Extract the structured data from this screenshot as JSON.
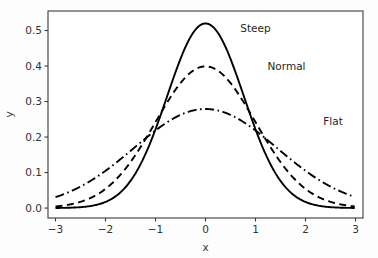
{
  "chart_data": {
    "type": "line",
    "title": "",
    "xlabel": "x",
    "ylabel": "y",
    "xlim": [
      -3.15,
      3.15
    ],
    "ylim": [
      -0.028,
      0.555
    ],
    "xticks": [
      -3,
      -2,
      -1,
      0,
      1,
      2,
      3
    ],
    "xticklabels": [
      "−3",
      "−2",
      "−1",
      "0",
      "1",
      "2",
      "3"
    ],
    "yticks": [
      0.0,
      0.1,
      0.2,
      0.3,
      0.4,
      0.5
    ],
    "yticklabels": [
      "0.0",
      "0.1",
      "0.2",
      "0.3",
      "0.4",
      "0.5"
    ],
    "grid": false,
    "legend_position": "inline-annotations",
    "series": [
      {
        "name": "Steep",
        "linestyle": "solid",
        "color": "#000000",
        "sigma": 0.766,
        "mu": 0,
        "peak_value": 0.52,
        "x": [
          -3.0,
          -2.75,
          -2.5,
          -2.25,
          -2.0,
          -1.75,
          -1.5,
          -1.25,
          -1.0,
          -0.75,
          -0.5,
          -0.25,
          0.0,
          0.25,
          0.5,
          0.75,
          1.0,
          1.25,
          1.5,
          1.75,
          2.0,
          2.25,
          2.5,
          2.75,
          3.0
        ],
        "values": [
          0.0005,
          0.0019,
          0.0061,
          0.0166,
          0.0389,
          0.0784,
          0.1361,
          0.2037,
          0.2629,
          0.2929,
          0.2819,
          0.2341,
          0.2069,
          0.2341,
          0.2819,
          0.2929,
          0.2629,
          0.2037,
          0.1361,
          0.0784,
          0.0389,
          0.0166,
          0.0061,
          0.0019,
          0.0005
        ]
      },
      {
        "name": "Normal",
        "linestyle": "dashed",
        "color": "#000000",
        "sigma": 1.0,
        "mu": 0,
        "peak_value": 0.399,
        "x": [
          -3.0,
          -2.5,
          -2.0,
          -1.5,
          -1.0,
          -0.5,
          0.0,
          0.5,
          1.0,
          1.5,
          2.0,
          2.5,
          3.0
        ],
        "values": [
          0.0044,
          0.0175,
          0.054,
          0.1295,
          0.242,
          0.3521,
          0.3989,
          0.3521,
          0.242,
          0.1295,
          0.054,
          0.0175,
          0.0044
        ]
      },
      {
        "name": "Flat",
        "linestyle": "dashdot",
        "color": "#000000",
        "sigma": 1.43,
        "mu": 0,
        "peak_value": 0.279,
        "x": [
          -3.0,
          -2.5,
          -2.0,
          -1.5,
          -1.0,
          -0.5,
          0.0,
          0.5,
          1.0,
          1.5,
          2.0,
          2.5,
          3.0
        ],
        "values": [
          0.0317,
          0.0639,
          0.1116,
          0.1686,
          0.2206,
          0.2616,
          0.279,
          0.2616,
          0.2206,
          0.1686,
          0.1116,
          0.0639,
          0.0317
        ]
      }
    ],
    "annotations": [
      {
        "text": "Steep",
        "x": 1.0,
        "y": 0.495
      },
      {
        "text": "Normal",
        "x": 1.62,
        "y": 0.39
      },
      {
        "text": "Flat",
        "x": 2.55,
        "y": 0.235
      }
    ]
  },
  "colors": {
    "background": "#fdfdfd",
    "axes": "#3b3b3b",
    "curve": "#000000",
    "text": "#333333"
  }
}
